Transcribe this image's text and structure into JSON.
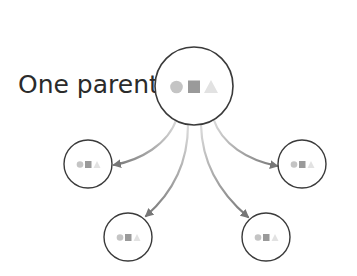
{
  "diagram": {
    "label": "One parent",
    "colors": {
      "node_stroke": "#3a3a3a",
      "arrow_start": "#d6d6d6",
      "arrow_end": "#7a7a7a",
      "icon_circle": "#c4c4c4",
      "icon_square": "#9a9a9a",
      "icon_triangle": "#e2e2e2",
      "text": "#2b2b2b"
    },
    "parent": {
      "name": "parent-node",
      "cx": 194,
      "cy": 86,
      "r": 39,
      "icons": [
        "circle",
        "square",
        "triangle"
      ]
    },
    "children": [
      {
        "name": "child-node-left",
        "cx": 88,
        "cy": 164,
        "r": 24
      },
      {
        "name": "child-node-bottom-left",
        "cx": 128,
        "cy": 237,
        "r": 24
      },
      {
        "name": "child-node-bottom-right",
        "cx": 266,
        "cy": 237,
        "r": 24
      },
      {
        "name": "child-node-right",
        "cx": 302,
        "cy": 164,
        "r": 24
      }
    ],
    "edges": [
      {
        "from": "parent-node",
        "to": "child-node-left"
      },
      {
        "from": "parent-node",
        "to": "child-node-bottom-left"
      },
      {
        "from": "parent-node",
        "to": "child-node-bottom-right"
      },
      {
        "from": "parent-node",
        "to": "child-node-right"
      }
    ]
  }
}
